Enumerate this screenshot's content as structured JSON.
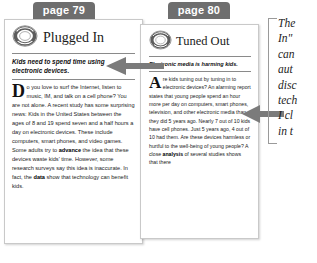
{
  "tabs": {
    "left_label": "page 79",
    "right_label": "page 80"
  },
  "articles": [
    {
      "id": "plugged-in",
      "logo_icon": "circular-ring-logo-icon",
      "masthead": "Plugged In",
      "standfirst": "Kids need to spend time using electronic devices.",
      "dropcap": "D",
      "body_start": "o you love to surf the Internet, listen to music, IM, and talk on a cell phone? You are not alone. A recent study has some surprising news: Kids in the United States between the ages of 8 and 19 spend seven and a half hours a day on electronic devices. These include computers, smart phones, and video games. Some adults try to ",
      "bold_one": "advance",
      "body_mid": " the idea that these devices waste kids' time. However, some research surveys say this idea is inaccurate. In fact, the ",
      "bold_two": "data",
      "body_end": " show that technology can benefit kids."
    },
    {
      "id": "tuned-out",
      "logo_icon": "circular-ring-logo-icon",
      "masthead": "Tuned Out",
      "standfirst": "Electronic media is harming kids.",
      "dropcap": "A",
      "body_start": "re kids tuning out by tuning in to electronic devices? An alarming report states that young people spend an hour more per day on computers, smart phones, television, and other electronic media than they did 5 years ago. Nearly 7 out of 10 kids have cell phones. Just 5 years ago, 4 out of 10 had them. Are these devices harmless or hurtful to the well-being of young people? A close ",
      "bold_one": "analysis",
      "body_mid": " of several studies shows that there",
      "bold_two": "",
      "body_end": ""
    }
  ],
  "annotations": {
    "arrow_middle_icon": "left-arrow-icon",
    "arrow_right_icon": "left-arrow-icon",
    "bracket_icon": "left-bracket-icon",
    "note_lines": [
      "The",
      "In\"",
      "can",
      "aut",
      "disc",
      "tech",
      "I cl",
      "in t"
    ]
  },
  "colors": {
    "tab_bg": "#6e6e6e",
    "tab_text": "#ffffff",
    "arrow": "#7b7b7b",
    "rule": "#8a8a8a",
    "card_border": "#c9c9c9"
  }
}
